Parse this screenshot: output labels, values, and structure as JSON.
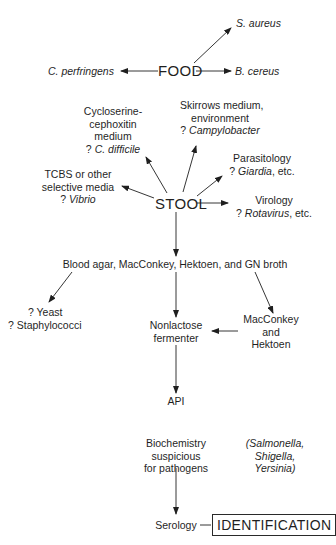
{
  "diagram": {
    "food": {
      "label": "FOOD",
      "targets": {
        "s_aureus": "S. aureus",
        "c_perfringens": "C. perfringens",
        "b_cereus": "B. cereus"
      }
    },
    "stool": {
      "label": "STOOL",
      "cyclo": {
        "line1": "Cycloserine-",
        "line2": "cephoxitin",
        "line3": "medium",
        "q": "? ",
        "organism": "C. difficile"
      },
      "skirrow": {
        "line1": "Skirrows medium,",
        "line2": "environment",
        "q": "? ",
        "organism": "Campylobacter"
      },
      "parasitology": {
        "line1": "Parasitology",
        "q": "? ",
        "organism": "Giardia",
        "suffix": ", etc."
      },
      "tcbs": {
        "line1": "TCBS or other",
        "line2": "selective media",
        "q": "? ",
        "organism": "Vibrio"
      },
      "virology": {
        "line1": "Virology",
        "q": "? ",
        "organism": "Rotavirus",
        "suffix": ", etc."
      }
    },
    "media": "Blood agar, MacConkey, Hektoen, and GN broth",
    "yeast": {
      "line1": "? Yeast",
      "line2": "? Staphylococci"
    },
    "nonlactose": {
      "line1": "Nonlactose",
      "line2": "fermenter"
    },
    "machek": {
      "line1": "MacConkey",
      "line2": "and",
      "line3": "Hektoen"
    },
    "api": "API",
    "biochem": {
      "line1": "Biochemistry",
      "line2": "suspicious",
      "line3": "for pathogens"
    },
    "pathogens": {
      "line1": "(Salmonella,",
      "line2": "Shigella,",
      "line3": "Yersinia)"
    },
    "serology": "Serology",
    "identification": "IDENTIFICATION"
  }
}
